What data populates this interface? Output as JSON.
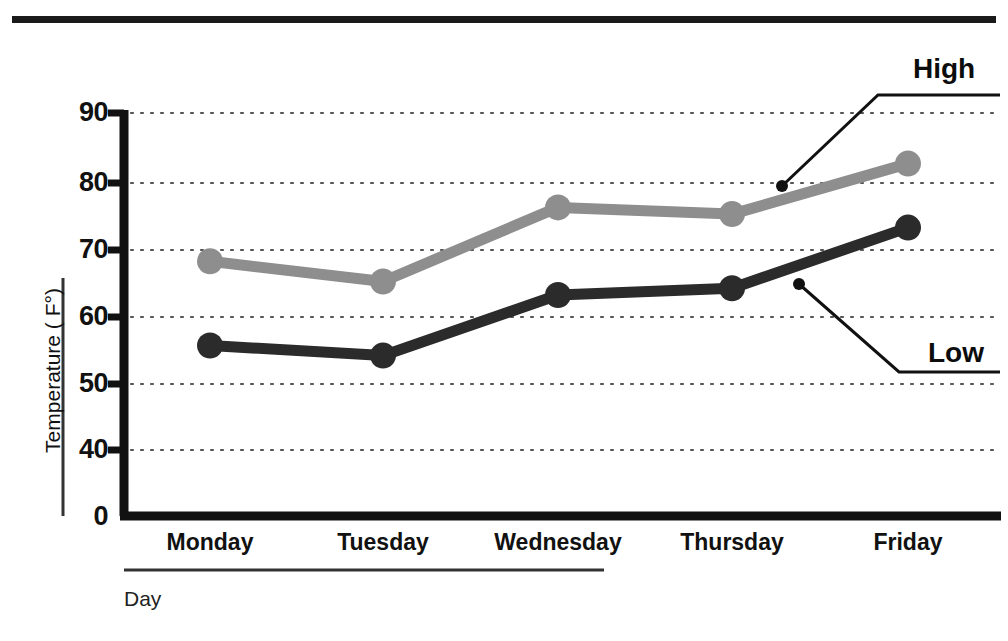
{
  "chart_data": {
    "type": "line",
    "title": "",
    "xlabel": "Day",
    "ylabel": "Temperature ( F°)",
    "categories": [
      "Monday",
      "Tuesday",
      "Wednesday",
      "Thursday",
      "Friday"
    ],
    "series": [
      {
        "name": "High",
        "values": [
          68,
          65,
          76,
          75,
          82.5
        ],
        "color": "#8e8e8e"
      },
      {
        "name": "Low",
        "values": [
          55.5,
          54,
          63,
          64,
          73
        ],
        "color": "#2b2b2b"
      }
    ],
    "ylim": [
      0,
      90
    ],
    "yticks": [
      "90",
      "80",
      "70",
      "60",
      "50",
      "40",
      "0"
    ],
    "ytick_values": [
      90,
      80,
      70,
      60,
      50,
      40,
      0
    ],
    "axis_break": true,
    "grid": "horizontal-dotted",
    "legend": "inline-callouts",
    "annotations": [
      {
        "text": "High",
        "target_series": "High",
        "target_point_x": 782,
        "target_point_y": 186
      },
      {
        "text": "Low",
        "target_series": "Low",
        "target_point_x": 799,
        "target_point_y": 284
      }
    ]
  },
  "axis": {
    "y_ticks": [
      {
        "label": "90",
        "value": 90
      },
      {
        "label": "80",
        "value": 80
      },
      {
        "label": "70",
        "value": 70
      },
      {
        "label": "60",
        "value": 60
      },
      {
        "label": "50",
        "value": 50
      },
      {
        "label": "40",
        "value": 40
      },
      {
        "label": "0",
        "value": 0
      }
    ],
    "x_ticks": [
      {
        "label": "Monday"
      },
      {
        "label": "Tuesday"
      },
      {
        "label": "Wednesday"
      },
      {
        "label": "Thursday"
      },
      {
        "label": "Friday"
      }
    ],
    "y_title": "Temperature ( F°)",
    "x_title": "Day"
  },
  "labels": {
    "high": "High",
    "low": "Low"
  },
  "colors": {
    "high_series": "#8e8e8e",
    "low_series": "#2b2b2b",
    "axis": "#111111",
    "grid": "#5a5a5a",
    "background": "#ffffff"
  }
}
